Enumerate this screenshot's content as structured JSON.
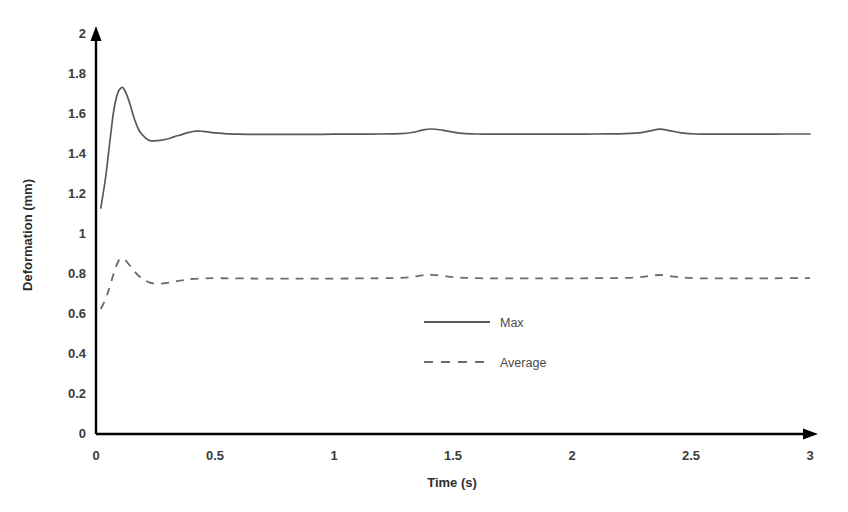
{
  "chart_data": {
    "type": "line",
    "title": "",
    "xlabel": "Time (s)",
    "ylabel": "Deformation (mm)",
    "xlim": [
      0,
      3
    ],
    "ylim": [
      0,
      2
    ],
    "xticks": [
      "0",
      "0.5",
      "1",
      "1.5",
      "2",
      "2.5",
      "3"
    ],
    "xtick_values": [
      0,
      0.5,
      1,
      1.5,
      2,
      2.5,
      3
    ],
    "yticks": [
      "0",
      "0.2",
      "0.4",
      "0.6",
      "0.8",
      "1",
      "1.2",
      "1.4",
      "1.6",
      "1.8",
      "2"
    ],
    "ytick_values": [
      0,
      0.2,
      0.4,
      0.6,
      0.8,
      1.0,
      1.2,
      1.4,
      1.6,
      1.8,
      2.0
    ],
    "grid": false,
    "legend_position": "center",
    "series": [
      {
        "name": "Max",
        "style": "solid",
        "color": "#595959",
        "x": [
          0.02,
          0.04,
          0.06,
          0.075,
          0.09,
          0.105,
          0.12,
          0.14,
          0.16,
          0.18,
          0.2,
          0.22,
          0.24,
          0.27,
          0.3,
          0.33,
          0.36,
          0.39,
          0.42,
          0.45,
          0.5,
          0.55,
          0.6,
          0.7,
          0.8,
          0.9,
          1.0,
          1.1,
          1.2,
          1.28,
          1.33,
          1.37,
          1.41,
          1.46,
          1.52,
          1.6,
          1.7,
          1.8,
          1.9,
          2.0,
          2.1,
          2.2,
          2.28,
          2.33,
          2.37,
          2.41,
          2.46,
          2.52,
          2.6,
          2.7,
          2.8,
          2.9,
          3.0
        ],
        "y": [
          1.13,
          1.28,
          1.48,
          1.62,
          1.7,
          1.73,
          1.72,
          1.66,
          1.58,
          1.52,
          1.49,
          1.47,
          1.466,
          1.468,
          1.475,
          1.487,
          1.497,
          1.508,
          1.514,
          1.513,
          1.506,
          1.501,
          1.499,
          1.498,
          1.498,
          1.498,
          1.499,
          1.499,
          1.5,
          1.502,
          1.508,
          1.519,
          1.525,
          1.518,
          1.506,
          1.5,
          1.499,
          1.499,
          1.499,
          1.499,
          1.5,
          1.501,
          1.506,
          1.516,
          1.524,
          1.517,
          1.506,
          1.5,
          1.499,
          1.499,
          1.499,
          1.5,
          1.5
        ]
      },
      {
        "name": "Average",
        "style": "dashed",
        "color": "#6b6b6b",
        "x": [
          0.02,
          0.04,
          0.06,
          0.075,
          0.09,
          0.105,
          0.12,
          0.14,
          0.16,
          0.18,
          0.2,
          0.22,
          0.24,
          0.27,
          0.3,
          0.33,
          0.36,
          0.4,
          0.45,
          0.5,
          0.6,
          0.7,
          0.8,
          0.9,
          1.0,
          1.1,
          1.2,
          1.28,
          1.33,
          1.37,
          1.41,
          1.46,
          1.52,
          1.6,
          1.7,
          1.8,
          1.9,
          2.0,
          2.1,
          2.2,
          2.28,
          2.33,
          2.37,
          2.41,
          2.46,
          2.52,
          2.6,
          2.7,
          2.8,
          2.9,
          3.0
        ],
        "y": [
          0.625,
          0.675,
          0.745,
          0.805,
          0.855,
          0.878,
          0.873,
          0.845,
          0.815,
          0.79,
          0.772,
          0.76,
          0.753,
          0.752,
          0.756,
          0.762,
          0.768,
          0.775,
          0.778,
          0.779,
          0.778,
          0.777,
          0.777,
          0.777,
          0.777,
          0.778,
          0.779,
          0.781,
          0.786,
          0.793,
          0.796,
          0.79,
          0.783,
          0.779,
          0.778,
          0.778,
          0.778,
          0.778,
          0.779,
          0.78,
          0.784,
          0.791,
          0.795,
          0.79,
          0.783,
          0.779,
          0.778,
          0.778,
          0.778,
          0.779,
          0.779
        ]
      }
    ]
  },
  "legend": {
    "entries": [
      {
        "label": "Max"
      },
      {
        "label": "Average"
      }
    ]
  },
  "axes": {
    "x_title": "Time (s)",
    "y_title": "Deformation (mm)"
  }
}
